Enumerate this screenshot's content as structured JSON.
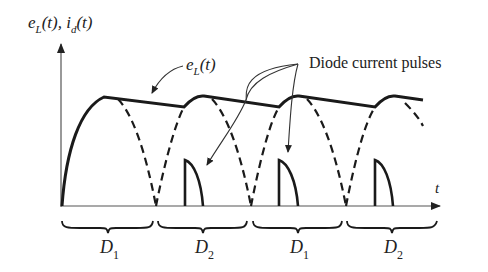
{
  "diagram": {
    "y_axis_label": {
      "e": "e",
      "L": "L",
      "t1": "(t), ",
      "i": "i",
      "d": "d",
      "t2": "(t)"
    },
    "x_axis_label": "t",
    "envelope_label": {
      "e": "e",
      "sub": "L",
      "arg": "(t)"
    },
    "pulses_label": "Diode current pulses",
    "intervals": [
      {
        "name": "D",
        "sub": "1"
      },
      {
        "name": "D",
        "sub": "2"
      },
      {
        "name": "D",
        "sub": "1"
      },
      {
        "name": "D",
        "sub": "2"
      }
    ],
    "colors": {
      "stroke": "#1a1a1a",
      "axis": "#555555",
      "background": "#ffffff"
    }
  }
}
